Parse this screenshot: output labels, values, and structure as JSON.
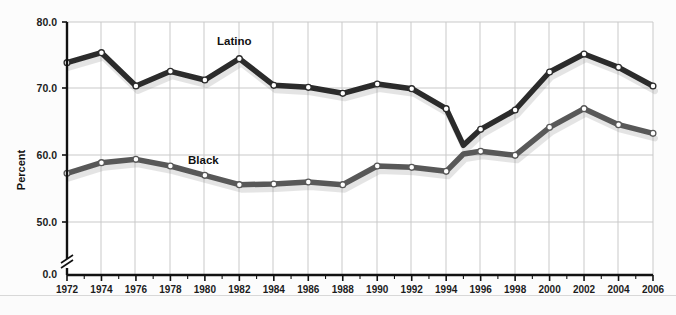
{
  "chart_data": {
    "type": "line",
    "title": "",
    "xlabel": "",
    "ylabel": "Percent",
    "xlim": [
      1972,
      2006
    ],
    "ylim": [
      45.0,
      80.0
    ],
    "y_ticks": [
      "80.0",
      "70.0",
      "60.0",
      "50.0",
      "0.0"
    ],
    "y_tick_values": [
      80.0,
      70.0,
      60.0,
      50.0
    ],
    "y_axis_break": true,
    "grid": true,
    "legend": "inline-labels",
    "x_tick_labels": [
      "1972",
      "1974",
      "1976",
      "1978",
      "1980",
      "1982",
      "1984",
      "1986",
      "1988",
      "1990",
      "1992",
      "1994",
      "1996",
      "1998",
      "2000",
      "2002",
      "2004",
      "2006"
    ],
    "x_minor_tick_step": 1,
    "x": [
      1972,
      1974,
      1976,
      1978,
      1980,
      1982,
      1984,
      1986,
      1988,
      1990,
      1992,
      1994,
      1995,
      1996,
      1998,
      2000,
      2002,
      2004,
      2006
    ],
    "series": [
      {
        "name": "Latino",
        "color": "#2b2b2b",
        "values": [
          73.9,
          75.4,
          70.4,
          72.6,
          71.3,
          74.5,
          70.5,
          70.2,
          69.3,
          70.7,
          70.0,
          67.0,
          61.5,
          63.9,
          66.8,
          72.5,
          75.2,
          73.2,
          70.4
        ]
      },
      {
        "name": "Black",
        "color": "#585858",
        "values": [
          57.3,
          58.9,
          59.4,
          58.4,
          57.0,
          55.6,
          55.7,
          56.0,
          55.6,
          58.4,
          58.2,
          57.6,
          60.2,
          60.6,
          60.0,
          64.2,
          67.0,
          64.6,
          63.3
        ]
      }
    ],
    "series_label_positions": [
      {
        "name": "Latino",
        "x": 217,
        "y": 45
      },
      {
        "name": "Black",
        "x": 188,
        "y": 164
      }
    ]
  }
}
